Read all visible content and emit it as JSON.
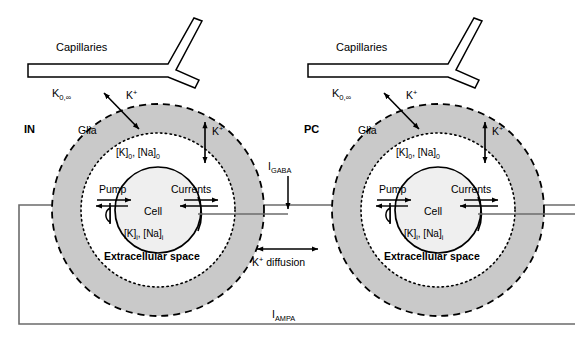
{
  "figure": {
    "width": 575,
    "height": 341,
    "background_color": "#ffffff",
    "line_color": "#000000",
    "glia_fill_color": "#c9c9c9",
    "cell_fill_color": "#efefef",
    "extracellular_fill_color": "#ffffff",
    "frame_color": "#6b6b6b"
  },
  "units": [
    {
      "id": "left",
      "cell_type_label": "IN",
      "capillaries_label": "Capillaries",
      "k_bulk_label": "K",
      "k_bulk_sub": "0,",
      "k_bulk_sup": "∞",
      "glia_label": "Glia",
      "k_flux_outer_label": "K",
      "k_flux_outer_sup": "+",
      "k_flux_inner_label": "K",
      "k_flux_inner_sup": "+",
      "extracellular_conc_label": "[K]",
      "extracellular_conc_sub_1": "0",
      "extracellular_conc_label_2": ", [Na]",
      "extracellular_conc_sub_2": "0",
      "intracellular_conc_label": "[K]",
      "intracellular_conc_sub_1": "i",
      "intracellular_conc_label_2": ", [Na]",
      "intracellular_conc_sub_2": "i",
      "pump_label": "Pump",
      "currents_label": "Currents",
      "cell_label": "Cell",
      "extracellular_space_label": "Extracellular space"
    },
    {
      "id": "right",
      "cell_type_label": "PC",
      "capillaries_label": "Capillaries",
      "k_bulk_label": "K",
      "k_bulk_sub": "0,",
      "k_bulk_sup": "∞",
      "glia_label": "Glia",
      "k_flux_outer_label": "K",
      "k_flux_outer_sup": "+",
      "k_flux_inner_label": "K",
      "k_flux_inner_sup": "+",
      "extracellular_conc_label": "[K]",
      "extracellular_conc_sub_1": "0",
      "extracellular_conc_label_2": ", [Na]",
      "extracellular_conc_sub_2": "0",
      "intracellular_conc_label": "[K]",
      "intracellular_conc_sub_1": "i",
      "intracellular_conc_label_2": ", [Na]",
      "intracellular_conc_sub_2": "i",
      "pump_label": "Pump",
      "currents_label": "Currents",
      "cell_label": "Cell",
      "extracellular_space_label": "Extracellular space"
    }
  ],
  "connections": {
    "igaba_label": "I",
    "igaba_sub": "GABA",
    "k_diffusion_label": "K",
    "k_diffusion_sup": "+",
    "k_diffusion_text": " diffusion",
    "iampa_label": "I",
    "iampa_sub": "AMPA"
  }
}
